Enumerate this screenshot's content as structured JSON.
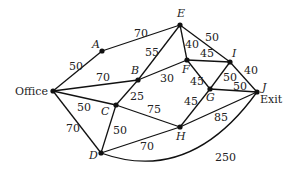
{
  "diagram": {
    "type": "weighted-graph",
    "nodes": [
      {
        "id": "Office",
        "label": "Office",
        "x": 53,
        "y": 91
      },
      {
        "id": "A",
        "label": "A",
        "x": 102,
        "y": 51
      },
      {
        "id": "B",
        "label": "B",
        "x": 138,
        "y": 80
      },
      {
        "id": "C",
        "label": "C",
        "x": 116,
        "y": 105
      },
      {
        "id": "D",
        "label": "D",
        "x": 101,
        "y": 153
      },
      {
        "id": "E",
        "label": "E",
        "x": 180,
        "y": 25
      },
      {
        "id": "F",
        "label": "F",
        "x": 187,
        "y": 60
      },
      {
        "id": "G",
        "label": "G",
        "x": 210,
        "y": 89
      },
      {
        "id": "H",
        "label": "H",
        "x": 180,
        "y": 127
      },
      {
        "id": "I",
        "label": "I",
        "x": 230,
        "y": 62
      },
      {
        "id": "J",
        "label": "J",
        "x": 257,
        "y": 92
      },
      {
        "exit_label": "Exit"
      }
    ],
    "exit_label": "Exit",
    "edges": [
      {
        "from": "Office",
        "to": "A",
        "weight": "50"
      },
      {
        "from": "A",
        "to": "E",
        "weight": "70"
      },
      {
        "from": "Office",
        "to": "B",
        "weight": "70"
      },
      {
        "from": "Office",
        "to": "C",
        "weight": "50"
      },
      {
        "from": "Office",
        "to": "D",
        "weight": "70"
      },
      {
        "from": "B",
        "to": "E",
        "weight": "55"
      },
      {
        "from": "B",
        "to": "F",
        "weight": "30"
      },
      {
        "from": "B",
        "to": "C",
        "weight": "25"
      },
      {
        "from": "C",
        "to": "D",
        "weight": "50"
      },
      {
        "from": "C",
        "to": "H",
        "weight": "75"
      },
      {
        "from": "D",
        "to": "H",
        "weight": "70"
      },
      {
        "from": "D",
        "to": "J",
        "weight": "250"
      },
      {
        "from": "E",
        "to": "F",
        "weight": "40"
      },
      {
        "from": "E",
        "to": "I",
        "weight": "50"
      },
      {
        "from": "F",
        "to": "I",
        "weight": "45"
      },
      {
        "from": "F",
        "to": "G",
        "weight": "45"
      },
      {
        "from": "G",
        "to": "I",
        "weight": "50"
      },
      {
        "from": "G",
        "to": "J",
        "weight": "50"
      },
      {
        "from": "G",
        "to": "H",
        "weight": "45"
      },
      {
        "from": "I",
        "to": "J",
        "weight": "40"
      },
      {
        "from": "H",
        "to": "J",
        "weight": "85"
      }
    ]
  }
}
